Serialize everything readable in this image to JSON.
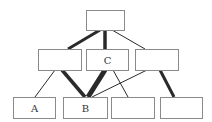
{
  "diagram": {
    "type": "hierarchy",
    "colors": {
      "edge": "#2a2a2a",
      "node_border": "#8a8a8a",
      "node_fill": "#ffffff",
      "label": "#333333"
    },
    "nodes": [
      {
        "id": "top",
        "label": "",
        "x": 86,
        "y": 10,
        "w": 38,
        "h": 20
      },
      {
        "id": "mid_left",
        "label": "",
        "x": 38,
        "y": 49,
        "w": 43,
        "h": 21
      },
      {
        "id": "mid_center",
        "label": "C",
        "x": 86,
        "y": 49,
        "w": 42,
        "h": 21
      },
      {
        "id": "mid_right",
        "label": "",
        "x": 135,
        "y": 49,
        "w": 43,
        "h": 21
      },
      {
        "id": "bot_1",
        "label": "A",
        "x": 13,
        "y": 97,
        "w": 42,
        "h": 21
      },
      {
        "id": "bot_2",
        "label": "B",
        "x": 63,
        "y": 97,
        "w": 44,
        "h": 21
      },
      {
        "id": "bot_3",
        "label": "",
        "x": 111,
        "y": 97,
        "w": 43,
        "h": 21
      },
      {
        "id": "bot_4",
        "label": "",
        "x": 160,
        "y": 97,
        "w": 42,
        "h": 21
      }
    ],
    "edges": [
      {
        "from": "top",
        "to": "mid_left",
        "weight": "thick",
        "x1": 100,
        "y1": 30,
        "x2": 68,
        "y2": 49,
        "stroke": 3
      },
      {
        "from": "top",
        "to": "mid_center",
        "weight": "thick",
        "x1": 105,
        "y1": 30,
        "x2": 105,
        "y2": 49,
        "stroke": 3.5
      },
      {
        "from": "top",
        "to": "mid_right",
        "weight": "thin",
        "x1": 112,
        "y1": 30,
        "x2": 145,
        "y2": 49,
        "stroke": 1
      },
      {
        "from": "mid_left",
        "to": "bot_1",
        "weight": "thin",
        "x1": 55,
        "y1": 70,
        "x2": 35,
        "y2": 97,
        "stroke": 1
      },
      {
        "from": "mid_left",
        "to": "bot_2",
        "weight": "thick",
        "x1": 62,
        "y1": 70,
        "x2": 85,
        "y2": 97,
        "stroke": 3.5
      },
      {
        "from": "mid_center",
        "to": "bot_2",
        "weight": "very-thick",
        "x1": 105,
        "y1": 70,
        "x2": 88,
        "y2": 97,
        "stroke": 5
      },
      {
        "from": "mid_center",
        "to": "bot_3",
        "weight": "thin",
        "x1": 113,
        "y1": 70,
        "x2": 128,
        "y2": 97,
        "stroke": 1
      },
      {
        "from": "mid_right",
        "to": "bot_2",
        "weight": "thin",
        "x1": 147,
        "y1": 70,
        "x2": 92,
        "y2": 97,
        "stroke": 1
      },
      {
        "from": "mid_right",
        "to": "bot_4",
        "weight": "thick",
        "x1": 160,
        "y1": 70,
        "x2": 174,
        "y2": 97,
        "stroke": 3
      }
    ]
  }
}
